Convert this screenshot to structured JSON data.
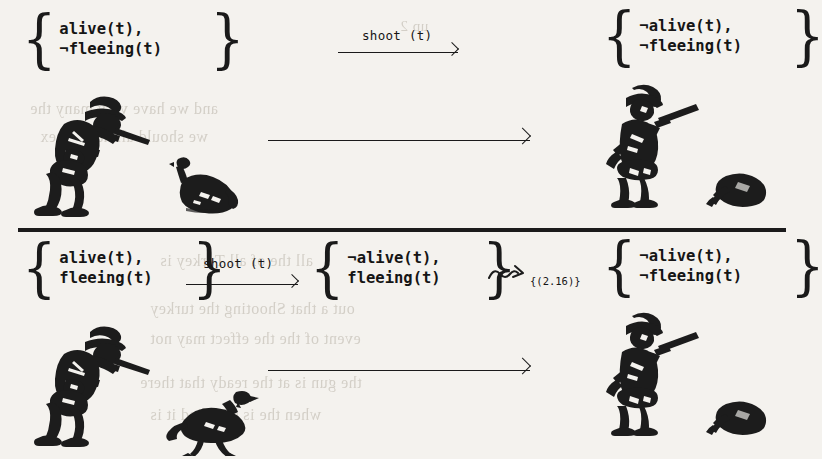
{
  "figure": {
    "ink_color": "#1a1a1a",
    "paper_color": "#f4f2ee"
  },
  "rows": [
    {
      "id": "row-top",
      "label_arrow": "shoot (t)",
      "precondition_set": {
        "line1": "alive(t),",
        "line2": "¬fleeing(t)"
      },
      "effect_set": {
        "line1": "¬alive(t),",
        "line2": "¬fleeing(t)"
      },
      "scene_before": {
        "hunter": "hunter-aiming",
        "turkey": "turkey-standing"
      },
      "scene_after": {
        "hunter": "hunter-shouldering-rifle",
        "turkey": "turkey-dead"
      }
    },
    {
      "id": "row-bottom",
      "label_arrow": "shoot (t)",
      "precondition_set": {
        "line1": "alive(t),",
        "line2": "fleeing(t)"
      },
      "intermediate_set": {
        "line1": "¬alive(t),",
        "line2": "fleeing(t)"
      },
      "squiggle_label": "{(2.16)}",
      "effect_set": {
        "line1": "¬alive(t),",
        "line2": "¬fleeing(t)"
      },
      "scene_before": {
        "hunter": "hunter-aiming",
        "turkey": "turkey-walking"
      },
      "scene_after": {
        "hunter": "hunter-shouldering-rifle",
        "turkey": "turkey-dead"
      }
    }
  ],
  "braces": {
    "left": "{",
    "right": "}"
  },
  "ghost_text": {
    "g1": "up 2",
    "g2": "and we have very many     the    ",
    "g3": "we should all have      or    ex",
    "g4": "and",
    "g5": "all the      of all      Turkey is",
    "g6": "out a     that  Shooting the turkey",
    "g7": "event of the     the  effect  may not",
    "g8": "the gun is at the ready that   there",
    "g9": "when the    is satisfied   it is"
  }
}
